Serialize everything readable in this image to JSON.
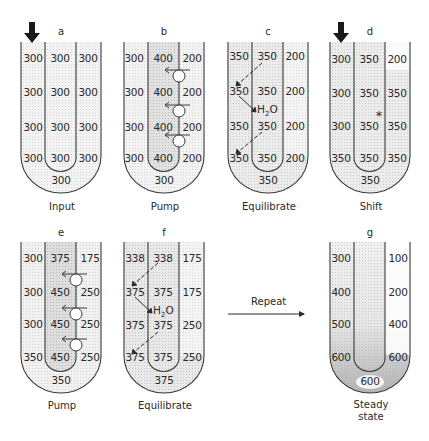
{
  "figure": {
    "panels": [
      {
        "id": "a",
        "letter": "a",
        "caption": "Input",
        "left": [
          300,
          300,
          300,
          300
        ],
        "middle": [
          300,
          300,
          300,
          300
        ],
        "right": [
          300,
          300,
          300,
          300
        ],
        "bottom": 300,
        "input_arrow": true,
        "pumps": false,
        "equilibrate": false,
        "asterisk": false
      },
      {
        "id": "b",
        "letter": "b",
        "caption": "Pump",
        "left": [
          300,
          300,
          300,
          300
        ],
        "middle": [
          400,
          400,
          400,
          400
        ],
        "right": [
          200,
          200,
          200,
          200
        ],
        "bottom": 300,
        "input_arrow": false,
        "pumps": true,
        "equilibrate": false,
        "asterisk": false
      },
      {
        "id": "c",
        "letter": "c",
        "caption": "Equilibrate",
        "left": [
          350,
          350,
          350,
          350
        ],
        "middle": [
          350,
          350,
          350,
          350
        ],
        "right": [
          200,
          200,
          200,
          200
        ],
        "bottom": 350,
        "input_arrow": false,
        "pumps": false,
        "equilibrate": true,
        "asterisk": false,
        "water_label": "H2O"
      },
      {
        "id": "d",
        "letter": "d",
        "caption": "Shift",
        "left": [
          300,
          300,
          300,
          350
        ],
        "middle": [
          350,
          350,
          350,
          350
        ],
        "right": [
          200,
          350,
          350,
          350
        ],
        "bottom": 350,
        "input_arrow": true,
        "pumps": false,
        "equilibrate": false,
        "asterisk": true
      },
      {
        "id": "e",
        "letter": "e",
        "caption": "Pump",
        "left": [
          300,
          300,
          300,
          350
        ],
        "middle": [
          375,
          450,
          450,
          450
        ],
        "right": [
          175,
          250,
          250,
          250
        ],
        "bottom": 350,
        "input_arrow": false,
        "pumps": true,
        "equilibrate": false,
        "asterisk": false
      },
      {
        "id": "f",
        "letter": "f",
        "caption": "Equilibrate",
        "left": [
          338,
          375,
          375,
          375
        ],
        "middle": [
          338,
          375,
          375,
          375
        ],
        "right": [
          175,
          175,
          250,
          250
        ],
        "bottom": 375,
        "input_arrow": false,
        "pumps": false,
        "equilibrate": true,
        "asterisk": false,
        "water_label": "H2O"
      },
      {
        "id": "g",
        "letter": "g",
        "caption": "Steady state",
        "left": [
          300,
          400,
          500,
          600
        ],
        "middle": [
          null,
          null,
          null,
          null
        ],
        "right": [
          100,
          200,
          400,
          600
        ],
        "bottom": 600,
        "input_arrow": false,
        "pumps": false,
        "equilibrate": false,
        "asterisk": false
      }
    ],
    "transition": {
      "label": "Repeat"
    },
    "labels": {
      "a_letter": "a",
      "b_letter": "b",
      "c_letter": "c",
      "d_letter": "d",
      "e_letter": "e",
      "f_letter": "f",
      "g_letter": "g",
      "a_caption": "Input",
      "b_caption": "Pump",
      "c_caption": "Equilibrate",
      "d_caption": "Shift",
      "e_caption": "Pump",
      "f_caption": "Equilibrate",
      "g_caption_1": "Steady",
      "g_caption_2": "state",
      "water_H": "H",
      "water_2": "2",
      "water_O": "O",
      "repeat": "Repeat",
      "asterisk": "*"
    },
    "values": {
      "a": {
        "l0": "300",
        "l1": "300",
        "l2": "300",
        "l3": "300",
        "m0": "300",
        "m1": "300",
        "m2": "300",
        "m3": "300",
        "r0": "300",
        "r1": "300",
        "r2": "300",
        "r3": "300",
        "b": "300"
      },
      "b": {
        "l0": "300",
        "l1": "300",
        "l2": "300",
        "l3": "300",
        "m0": "400",
        "m1": "400",
        "m2": "400",
        "m3": "400",
        "r0": "200",
        "r1": "200",
        "r2": "200",
        "r3": "200",
        "b": "300"
      },
      "c": {
        "l0": "350",
        "l1": "350",
        "l2": "350",
        "l3": "350",
        "m0": "350",
        "m1": "350",
        "m2": "350",
        "m3": "350",
        "r0": "200",
        "r1": "200",
        "r2": "200",
        "r3": "200",
        "b": "350"
      },
      "d": {
        "l0": "300",
        "l1": "300",
        "l2": "300",
        "l3": "350",
        "m0": "350",
        "m1": "350",
        "m2": "350",
        "m3": "350",
        "r0": "200",
        "r1": "350",
        "r2": "350",
        "r3": "350",
        "b": "350"
      },
      "e": {
        "l0": "300",
        "l1": "300",
        "l2": "300",
        "l3": "350",
        "m0": "375",
        "m1": "450",
        "m2": "450",
        "m3": "450",
        "r0": "175",
        "r1": "250",
        "r2": "250",
        "r3": "250",
        "b": "350"
      },
      "f": {
        "l0": "338",
        "l1": "375",
        "l2": "375",
        "l3": "375",
        "m0": "338",
        "m1": "375",
        "m2": "375",
        "m3": "375",
        "r0": "175",
        "r1": "175",
        "r2": "250",
        "r3": "250",
        "b": "375"
      },
      "g": {
        "l0": "300",
        "l1": "400",
        "l2": "500",
        "l3": "600",
        "r0": "100",
        "r1": "200",
        "r2": "400",
        "r3": "600",
        "b": "600"
      }
    },
    "colors": {
      "stroke": "#3a3a3a",
      "stipple_light": "#ececec",
      "stipple_mid": "#dcdcdc",
      "stipple_dark": "#c4c4c4",
      "text": "#2a2a2a"
    }
  }
}
